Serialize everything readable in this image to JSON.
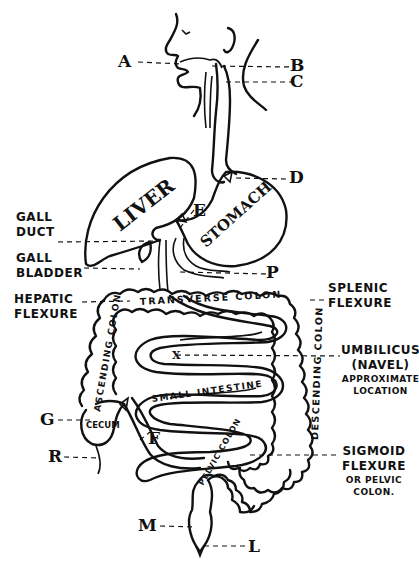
{
  "diagram": {
    "point_labels": {
      "A": "A",
      "B": "B",
      "C": "C",
      "D": "D",
      "E": "E",
      "P": "P",
      "G": "G",
      "R": "R",
      "F": "F",
      "M": "M",
      "L": "L",
      "X": "X"
    },
    "annotations": {
      "gall_duct": [
        "GALL",
        "DUCT"
      ],
      "gall_bladder": [
        "GALL",
        "BLADDER"
      ],
      "hepatic_flexure": [
        "HEPATIC",
        "FLEXURE"
      ],
      "splenic_flexure": [
        "SPLENIC",
        "FLEXURE"
      ],
      "umbilicus": [
        "UMBILICUS",
        "(NAVEL)",
        "APPROXIMATE",
        "LOCATION"
      ],
      "sigmoid_flexure": [
        "SIGMOID",
        "FLEXURE",
        "OR PELVIC",
        "COLON."
      ]
    },
    "organs": {
      "liver": "LIVER",
      "stomach": "STOMACH",
      "transverse_colon": "TRANSVERSE COLON",
      "ascending_colon": "ASCENDING COLON",
      "descending_colon": "DESCENDING COLON",
      "small_intestine": "SMALL INTESTINE",
      "cecum": "CECUM",
      "pelvic_colon": "PELVIC COLON"
    },
    "colors": {
      "ink": "#111111",
      "background": "#ffffff"
    }
  }
}
